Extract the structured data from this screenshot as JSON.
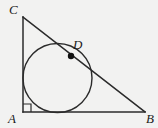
{
  "figure": {
    "kind": "geometry-diagram",
    "background_color": "#f2f2f1",
    "stroke_color": "#2b2b2b",
    "label_color": "#1a1a1a",
    "stroke_width": 1.4,
    "labels": {
      "A": "A",
      "B": "B",
      "C": "C",
      "D": "D"
    },
    "points": {
      "A": {
        "x": 23,
        "y": 112
      },
      "B": {
        "x": 145,
        "y": 112
      },
      "C": {
        "x": 23,
        "y": 17
      },
      "D": {
        "x": 71,
        "y": 56
      }
    },
    "segments": [
      {
        "name": "AC",
        "from": "A",
        "to": "C"
      },
      {
        "name": "AB",
        "from": "A",
        "to": "B"
      },
      {
        "name": "CB",
        "from": "C",
        "to": "B"
      }
    ],
    "incircle": {
      "cx": 57.5,
      "cy": 78,
      "r": 34.5,
      "fill": "none"
    },
    "right_angle_marker": {
      "at": "A",
      "size": 8
    },
    "point_marker": {
      "at": "D",
      "radius": 3.2,
      "fill": "#111111"
    }
  }
}
